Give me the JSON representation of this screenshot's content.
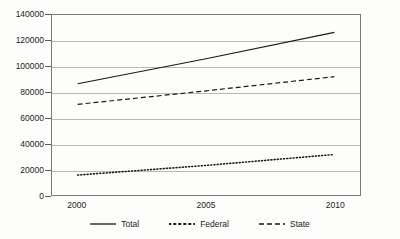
{
  "chart_data": {
    "type": "line",
    "title": "",
    "xlabel": "",
    "ylabel": "",
    "xlim": [
      1999,
      2011
    ],
    "ylim": [
      0,
      140000
    ],
    "grid": true,
    "legend_position": "bottom",
    "x": [
      2000,
      2005,
      2010
    ],
    "categories": [
      "2000",
      "2005",
      "2010"
    ],
    "y_ticks": [
      0,
      20000,
      40000,
      60000,
      80000,
      100000,
      120000,
      140000
    ],
    "y_tick_labels": [
      "0",
      "20000",
      "40000",
      "60000",
      "80000",
      "100000",
      "120000",
      "140000"
    ],
    "x_tick_labels": [
      "2000",
      "2005",
      "2010"
    ],
    "series": [
      {
        "name": "Total",
        "style": "solid",
        "color": "#1a1a1a",
        "values": [
          86500,
          106000,
          126500
        ]
      },
      {
        "name": "Federal",
        "style": "dotted",
        "color": "#1a1a1a",
        "values": [
          15500,
          23000,
          31500
        ]
      },
      {
        "name": "State",
        "style": "dashed",
        "color": "#1a1a1a",
        "values": [
          70500,
          81000,
          92000
        ]
      }
    ]
  },
  "legend": {
    "items": [
      {
        "label": "Total",
        "style": "solid"
      },
      {
        "label": "Federal",
        "style": "dotted"
      },
      {
        "label": "State",
        "style": "dashed"
      }
    ]
  },
  "colors": {
    "background": "#fdfdfb",
    "axis": "#7a7a74",
    "gridline": "#b9b9b2",
    "text": "#1c1c1c",
    "series": "#1a1a1a"
  }
}
